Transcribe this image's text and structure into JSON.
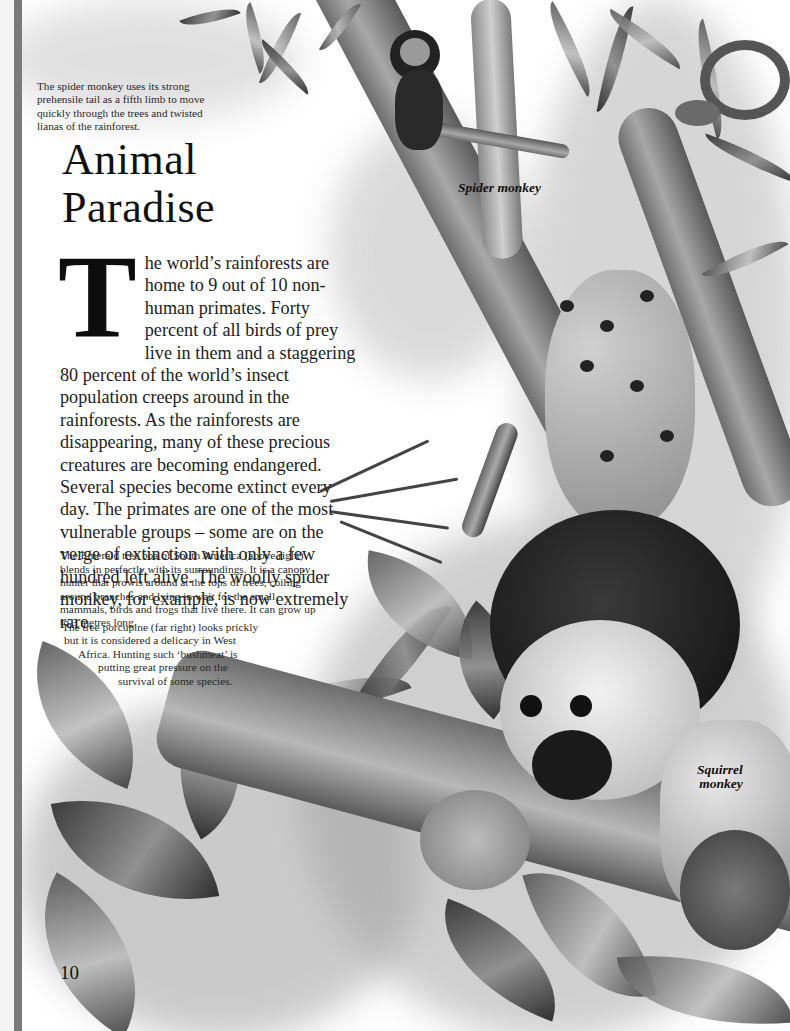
{
  "page": {
    "title_line1": "Animal",
    "title_line2": "Paradise",
    "page_number": "10"
  },
  "captions": {
    "spider_monkey_tail": "The spider monkey uses its strong prehensile tail as a fifth limb to move quickly through the trees and twisted lianas of the rainforest.",
    "emerald_boa": "The Emerald tree boa of South America (above right) blends in perfectly with its surroundings. It is a canopy hunter that prowls around at the tops of trees, coiling around branches and lying in wait for the small mammals, birds and frogs that live there. It can grow up to 3 metres long.",
    "tree_porcupine": {
      "line1": "The tree porcupine (far right) looks prickly",
      "line2": "but it is considered a delicacy in West",
      "line3": "Africa. Hunting such ‘bushmeat’ is",
      "line4": "putting great pressure on the",
      "line5": "survival of some species."
    }
  },
  "body": {
    "drop_cap": "T",
    "text": "he world’s rainforests are home to 9 out of 10 non-human primates. Forty percent of all birds of prey live in them and a staggering 80 percent of the world’s insect population creeps around in the rainforests. As the rainforests are disappearing, many of these precious creatures are becoming endangered. Several species become extinct every day. The primates are one of the most vulnerable groups – some are on the verge of extinction with only a few hundred left alive. The woolly spider monkey, for example, is now extremely rare."
  },
  "labels": {
    "spider_monkey": "Spider monkey",
    "squirrel_monkey_line1": "Squirrel",
    "squirrel_monkey_line2": "monkey"
  }
}
